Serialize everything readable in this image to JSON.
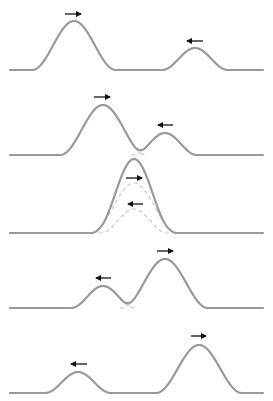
{
  "diagram": {
    "colors": {
      "wave": "#999999",
      "dashed": "#c4c4c4",
      "arrow": "#111111",
      "background": "#ffffff"
    },
    "panels": [
      {
        "id": "panel-1",
        "description": "Pulses approaching",
        "baseline_y": 70,
        "x_start": 10,
        "x_end": 263,
        "pulses": [
          {
            "center_x": 74,
            "half_width": 42,
            "height": 49,
            "direction": "right"
          },
          {
            "center_x": 195,
            "half_width": 33,
            "height": 22,
            "direction": "left"
          }
        ],
        "arrows": [
          {
            "x1": 65,
            "x2": 81,
            "y": 14,
            "direction": "right"
          },
          {
            "x1": 187,
            "x2": 203,
            "y": 41,
            "direction": "left"
          }
        ],
        "show_components": false
      },
      {
        "id": "panel-2",
        "description": "Pulses beginning to overlap",
        "baseline_y": 155,
        "x_start": 10,
        "x_end": 263,
        "pulses": [
          {
            "center_x": 103,
            "half_width": 43,
            "height": 50,
            "direction": "right"
          },
          {
            "center_x": 165,
            "half_width": 32,
            "height": 22,
            "direction": "left"
          }
        ],
        "arrows": [
          {
            "x1": 94,
            "x2": 110,
            "y": 97,
            "direction": "right"
          },
          {
            "x1": 158,
            "x2": 173,
            "y": 125,
            "direction": "left"
          }
        ],
        "show_components": true
      },
      {
        "id": "panel-3",
        "description": "Complete overlap — amplitudes add",
        "baseline_y": 233,
        "x_start": 10,
        "x_end": 263,
        "pulses": [
          {
            "center_x": 134,
            "half_width": 43,
            "height": 50,
            "direction": "right"
          },
          {
            "center_x": 134,
            "half_width": 33,
            "height": 24,
            "direction": "left"
          }
        ],
        "arrows": [
          {
            "x1": 126,
            "x2": 142,
            "y": 178,
            "direction": "right"
          },
          {
            "x1": 128,
            "x2": 143,
            "y": 204,
            "direction": "left"
          }
        ],
        "show_components": true
      },
      {
        "id": "panel-4",
        "description": "Pulses separating",
        "baseline_y": 308,
        "x_start": 10,
        "x_end": 263,
        "pulses": [
          {
            "center_x": 165,
            "half_width": 43,
            "height": 49,
            "direction": "right"
          },
          {
            "center_x": 103,
            "half_width": 32,
            "height": 22,
            "direction": "left"
          }
        ],
        "arrows": [
          {
            "x1": 157,
            "x2": 173,
            "y": 251,
            "direction": "right"
          },
          {
            "x1": 96,
            "x2": 111,
            "y": 278,
            "direction": "left"
          }
        ],
        "show_components": true
      },
      {
        "id": "panel-5",
        "description": "Pulses emerge unchanged",
        "baseline_y": 393,
        "x_start": 10,
        "x_end": 263,
        "pulses": [
          {
            "center_x": 199,
            "half_width": 43,
            "height": 48,
            "direction": "right"
          },
          {
            "center_x": 78,
            "half_width": 33,
            "height": 21,
            "direction": "left"
          }
        ],
        "arrows": [
          {
            "x1": 191,
            "x2": 206,
            "y": 336,
            "direction": "right"
          },
          {
            "x1": 71,
            "x2": 87,
            "y": 364,
            "direction": "left"
          }
        ],
        "show_components": false
      }
    ]
  }
}
